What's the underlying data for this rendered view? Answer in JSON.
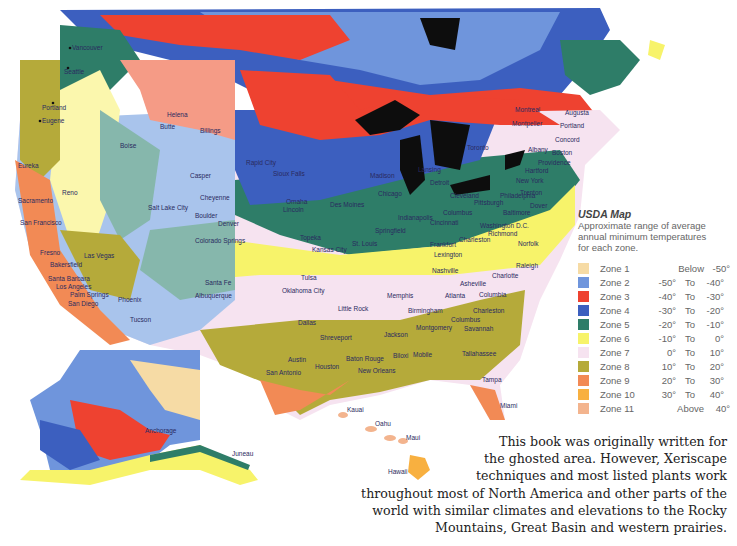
{
  "map": {
    "title": "USDA Map",
    "regions": [
      "Contiguous United States",
      "Southern Canada",
      "Alaska",
      "Hawaii"
    ],
    "colors": {
      "zone1": "#f6dba5",
      "zone2": "#6f95dc",
      "zone3": "#ee4230",
      "zone4": "#3c5fbf",
      "zone5": "#2e7d68",
      "zone6": "#f7f36a",
      "zone7": "#f6e3f0",
      "zone8": "#b5aa3a",
      "zone9": "#f28a55",
      "zone10": "#f8b040",
      "zone11": "#f3b48e",
      "lakes": "#0d0d0d",
      "ghosted_zone2": "#a9c4ec",
      "ghosted_zone3": "#f59b86",
      "ghosted_zone5": "#86b7ac",
      "ghosted_zone6": "#fbf7ad"
    },
    "cities": [
      "Vancouver",
      "Seattle",
      "Portland",
      "Eugene",
      "Eureka",
      "Reno",
      "Sacramento",
      "San Francisco",
      "Fresno",
      "Bakersfield",
      "Las Vegas",
      "Santa Barbara",
      "Los Angeles",
      "Palm Springs",
      "San Diego",
      "Phoenix",
      "Tucson",
      "Boise",
      "Helena",
      "Butte",
      "Billings",
      "Casper",
      "Rapid City",
      "Salt Lake City",
      "Cheyenne",
      "Boulder",
      "Denver",
      "Colorado Springs",
      "Santa Fe",
      "Albuquerque",
      "Sioux Falls",
      "Omaha",
      "Lincoln",
      "Des Moines",
      "Topeka",
      "Madison",
      "Chicago",
      "Lansing",
      "Detroit",
      "Toronto",
      "Montreal",
      "Augusta",
      "Montpelier",
      "Portland (ME)",
      "Concord",
      "Albany",
      "Boston",
      "Providence",
      "Hartford",
      "New York",
      "Trenton",
      "Philadelphia",
      "Dover",
      "Baltimore",
      "Washington D.C.",
      "Richmond",
      "Norfolk",
      "Raleigh",
      "Pittsburgh",
      "Cleveland",
      "Columbus",
      "Cincinnati",
      "Indianapolis",
      "Springfield",
      "St. Louis",
      "Kansas City",
      "Frankfort",
      "Lexington",
      "Charleston (WV)",
      "Nashville",
      "Asheville",
      "Charlotte",
      "Columbia",
      "Charleston (SC)",
      "Atlanta",
      "Memphis",
      "Birmingham",
      "Little Rock",
      "Tulsa",
      "Oklahoma City",
      "Dallas",
      "Shreveport",
      "Jackson",
      "Montgomery",
      "Columbus (GA)",
      "Savannah",
      "Tallahassee",
      "Austin",
      "San Antonio",
      "Houston",
      "Baton Rouge",
      "New Orleans",
      "Biloxi",
      "Mobile",
      "Tampa",
      "Miami",
      "Juneau",
      "Anchorage",
      "Kauai",
      "Oahu",
      "Maui",
      "Hawaii"
    ]
  },
  "legend": {
    "title": "USDA Map",
    "description_lines": [
      "Approximate range of average",
      "annual minimum temperatures",
      "for each zone."
    ],
    "zones": [
      {
        "name": "Zone 1",
        "range_text": "Below",
        "value": "-50°",
        "color": "#f6dba5"
      },
      {
        "name": "Zone 2",
        "from": "-50°",
        "to_label": "To",
        "to": "-40°",
        "color": "#6f95dc"
      },
      {
        "name": "Zone 3",
        "from": "-40°",
        "to_label": "To",
        "to": "-30°",
        "color": "#ee4230"
      },
      {
        "name": "Zone 4",
        "from": "-30°",
        "to_label": "To",
        "to": "-20°",
        "color": "#3c5fbf"
      },
      {
        "name": "Zone 5",
        "from": "-20°",
        "to_label": "To",
        "to": "-10°",
        "color": "#2e7d68"
      },
      {
        "name": "Zone 6",
        "from": "-10°",
        "to_label": "To",
        "to": "0°",
        "color": "#f7f36a"
      },
      {
        "name": "Zone 7",
        "from": "0°",
        "to_label": "To",
        "to": "10°",
        "color": "#f6e3f0"
      },
      {
        "name": "Zone 8",
        "from": "10°",
        "to_label": "To",
        "to": "20°",
        "color": "#b5aa3a"
      },
      {
        "name": "Zone 9",
        "from": "20°",
        "to_label": "To",
        "to": "30°",
        "color": "#f28a55"
      },
      {
        "name": "Zone 10",
        "from": "30°",
        "to_label": "To",
        "to": "40°",
        "color": "#f8b040"
      },
      {
        "name": "Zone 11",
        "range_text": "Above",
        "value": "40°",
        "color": "#f3b48e"
      }
    ]
  },
  "note": {
    "lines": [
      "This book was originally written for",
      "the ghosted area. However, Xeriscape",
      "techniques and most listed plants work",
      "throughout most of North America and other parts of the",
      "world with similar climates and elevations to the Rocky",
      "Mountains, Great Basin and western prairies."
    ]
  }
}
